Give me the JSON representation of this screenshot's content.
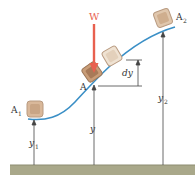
{
  "diagram": {
    "labels": {
      "weight": "W",
      "point_a": "A",
      "point_a1": "A",
      "point_a1_sub": "1",
      "point_a2": "A",
      "point_a2_sub": "2",
      "dy": "dy",
      "y": "y",
      "y1": "y",
      "y1_sub": "1",
      "y2": "y",
      "y2_sub": "2"
    },
    "colors": {
      "curve": "#3a8fc6",
      "weight_arrow": "#e8604f",
      "weight_label": "#e8604f",
      "ground": "#a9a88a",
      "ground_edge": "#8d8c70",
      "block_face": "#d9b89a",
      "block_edge": "#b89a80",
      "block_dark": "#a87a58",
      "lines": "#444444"
    }
  }
}
